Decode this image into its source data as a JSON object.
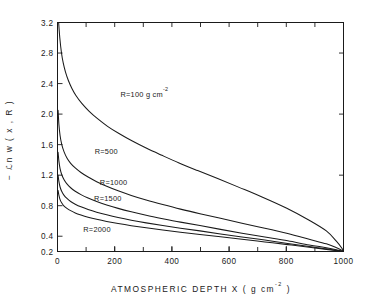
{
  "chart_data": {
    "type": "line",
    "title": "",
    "xlabel": "ATMOSPHERIC  DEPTH  X ( g cm",
    "xlabel_sup": "-2",
    "xlabel_tail": " )",
    "ylabel_prefix": "−",
    "ylabel": "ℒn w ( x , R )",
    "xlim": [
      0,
      1000
    ],
    "ylim": [
      0.2,
      3.2
    ],
    "xticks": [
      0,
      200,
      400,
      600,
      800,
      1000
    ],
    "xtick_labels": [
      "0",
      "200",
      "400",
      "600",
      "800",
      "1000"
    ],
    "xminor_step": 100,
    "yticks": [
      0.2,
      0.4,
      0.8,
      1.2,
      1.6,
      2.0,
      2.4,
      2.8,
      3.2
    ],
    "ytick_labels": [
      "0.2",
      "0.4",
      "0.8",
      "1.2",
      "1.6",
      "2.0",
      "2.4",
      "2.8",
      "3.2"
    ],
    "grid": false,
    "legend": "inline-curve-labels",
    "series": [
      {
        "name": "R=100 g cm-2",
        "label": "R=100 g cm",
        "label_sup": "-2",
        "label_x": 220,
        "label_y": 2.23,
        "x": [
          4,
          8,
          14,
          20,
          28,
          38,
          50,
          65,
          85,
          110,
          140,
          175,
          215,
          260,
          310,
          365,
          425,
          490,
          560,
          635,
          715,
          800,
          880,
          940,
          975,
          995,
          1000
        ],
        "y": [
          3.2,
          3.0,
          2.8,
          2.67,
          2.55,
          2.44,
          2.34,
          2.24,
          2.14,
          2.04,
          1.94,
          1.84,
          1.745,
          1.65,
          1.555,
          1.46,
          1.36,
          1.26,
          1.155,
          1.04,
          0.915,
          0.77,
          0.61,
          0.47,
          0.335,
          0.24,
          0.2
        ]
      },
      {
        "name": "R=500",
        "label": "R=500",
        "label_sup": "",
        "label_x": 130,
        "label_y": 1.48,
        "x": [
          2,
          5,
          9,
          15,
          23,
          33,
          46,
          62,
          82,
          107,
          137,
          172,
          212,
          258,
          310,
          368,
          430,
          498,
          570,
          645,
          725,
          805,
          880,
          940,
          978,
          995,
          1000
        ],
        "y": [
          2.05,
          1.86,
          1.72,
          1.6,
          1.505,
          1.425,
          1.355,
          1.295,
          1.235,
          1.175,
          1.115,
          1.055,
          0.995,
          0.935,
          0.875,
          0.815,
          0.755,
          0.695,
          0.635,
          0.57,
          0.505,
          0.435,
          0.36,
          0.3,
          0.245,
          0.215,
          0.2
        ]
      },
      {
        "name": "R=1000",
        "label": "R=1000",
        "label_sup": "",
        "label_x": 148,
        "label_y": 1.07,
        "x": [
          2,
          5,
          9,
          15,
          23,
          33,
          46,
          62,
          82,
          107,
          137,
          172,
          212,
          258,
          310,
          368,
          430,
          498,
          570,
          645,
          725,
          805,
          880,
          940,
          978,
          995,
          1000
        ],
        "y": [
          1.5,
          1.38,
          1.285,
          1.205,
          1.14,
          1.085,
          1.035,
          0.99,
          0.945,
          0.9,
          0.855,
          0.81,
          0.765,
          0.72,
          0.675,
          0.63,
          0.585,
          0.54,
          0.49,
          0.44,
          0.39,
          0.34,
          0.285,
          0.25,
          0.22,
          0.205,
          0.2
        ]
      },
      {
        "name": "R=1500",
        "label": "R=1500",
        "label_sup": "",
        "label_x": 128,
        "label_y": 0.865,
        "x": [
          2,
          5,
          9,
          15,
          23,
          33,
          46,
          62,
          82,
          107,
          137,
          172,
          212,
          258,
          310,
          368,
          430,
          498,
          570,
          645,
          725,
          805,
          880,
          940,
          978,
          995,
          1000
        ],
        "y": [
          1.2,
          1.115,
          1.045,
          0.985,
          0.935,
          0.895,
          0.855,
          0.82,
          0.785,
          0.75,
          0.715,
          0.68,
          0.645,
          0.61,
          0.575,
          0.54,
          0.505,
          0.47,
          0.43,
          0.39,
          0.35,
          0.305,
          0.265,
          0.235,
          0.212,
          0.203,
          0.2
        ]
      },
      {
        "name": "R=2000",
        "label": "R=2000",
        "label_sup": "",
        "label_x": 90,
        "label_y": 0.455,
        "x": [
          2,
          5,
          9,
          15,
          23,
          33,
          46,
          62,
          82,
          107,
          137,
          172,
          212,
          258,
          310,
          368,
          430,
          498,
          570,
          645,
          725,
          805,
          880,
          940,
          978,
          995,
          1000
        ],
        "y": [
          1.0,
          0.935,
          0.88,
          0.835,
          0.795,
          0.765,
          0.735,
          0.705,
          0.678,
          0.65,
          0.622,
          0.594,
          0.566,
          0.538,
          0.51,
          0.482,
          0.453,
          0.424,
          0.392,
          0.36,
          0.325,
          0.29,
          0.255,
          0.228,
          0.209,
          0.202,
          0.2
        ]
      }
    ]
  }
}
